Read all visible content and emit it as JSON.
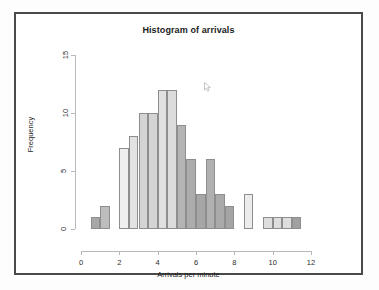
{
  "window": {
    "frame_border_color": "#4a4a4a",
    "background": "#ffffff"
  },
  "chart_data": {
    "type": "bar",
    "title": "Histogram of arrivals",
    "xlabel": "Arrivals per minute",
    "ylabel": "Frequency",
    "xlim": [
      0,
      12
    ],
    "ylim": [
      0,
      15
    ],
    "xticks": [
      0,
      2,
      4,
      6,
      8,
      10,
      12
    ],
    "yticks": [
      0,
      5,
      10,
      15
    ],
    "grid": false,
    "legend": null,
    "bin_width": 0.5,
    "bin_starts": [
      0.5,
      1.0,
      1.5,
      2.0,
      2.5,
      3.0,
      3.5,
      4.0,
      4.5,
      5.0,
      5.5,
      6.0,
      6.5,
      7.0,
      7.5,
      8.0,
      8.5,
      9.0,
      9.5,
      10.0,
      10.5,
      11.0
    ],
    "values": [
      1,
      2,
      0,
      7,
      8,
      10,
      10,
      12,
      12,
      9,
      6,
      3,
      6,
      3,
      2,
      0,
      3,
      0,
      1,
      1,
      1,
      1
    ],
    "bar_fills": [
      "#a8a8a8",
      "#bdbdbd",
      "#ffffff",
      "#efefef",
      "#e2e2e2",
      "#d4d4d4",
      "#d4d4d4",
      "#e0e0e0",
      "#dcdcdc",
      "#b4b4b4",
      "#acacac",
      "#a6a6a6",
      "#b0b0b0",
      "#aaaaaa",
      "#a4a4a4",
      "#ffffff",
      "#ececec",
      "#ffffff",
      "#dedede",
      "#dedede",
      "#dedede",
      "#a0a0a0"
    ],
    "bar_border_color": "#8e8e8e"
  }
}
